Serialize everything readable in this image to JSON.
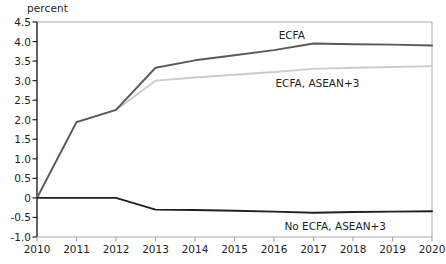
{
  "chart_data": {
    "type": "line",
    "title": "",
    "subtitle": "",
    "xlabel": "",
    "ylabel": "percent",
    "ylim": [
      -1.0,
      4.5
    ],
    "xlim": [
      2010,
      2020
    ],
    "grid": false,
    "legend_position": "inline-annotations",
    "ytick_labels": [
      "4.5",
      "4.0",
      "3.5",
      "3.0",
      "2.5",
      "2.0",
      "1.5",
      "1.0",
      "0.5",
      "0",
      "-0.5",
      "-1.0"
    ],
    "ytick_values": [
      4.5,
      4.0,
      3.5,
      3.0,
      2.5,
      2.0,
      1.5,
      1.0,
      0.5,
      0,
      -0.5,
      -1.0
    ],
    "x": [
      2010,
      2011,
      2012,
      2013,
      2014,
      2015,
      2016,
      2017,
      2018,
      2019,
      2020
    ],
    "xtick_labels": [
      "2010",
      "2011",
      "2012",
      "2013",
      "2014",
      "2015",
      "2016",
      "2017",
      "2018",
      "2019",
      "2020"
    ],
    "series": [
      {
        "name": "ECFA",
        "color": "#58595b",
        "width": 1.9,
        "values": [
          0.0,
          1.94,
          2.25,
          3.33,
          3.52,
          3.65,
          3.78,
          3.95,
          3.93,
          3.92,
          3.9
        ],
        "label": "ECFA",
        "label_x": 2016.45,
        "label_y": 4.18
      },
      {
        "name": "ECFA, ASEAN+3",
        "color": "#cccccc",
        "width": 1.9,
        "values": [
          0.0,
          1.94,
          2.25,
          3.0,
          3.08,
          3.15,
          3.22,
          3.3,
          3.33,
          3.35,
          3.37
        ],
        "label": "ECFA, ASEAN+3",
        "label_x": 2017.1,
        "label_y": 2.95
      },
      {
        "name": "No ECFA, ASEAN+3",
        "color": "#231f20",
        "width": 1.9,
        "values": [
          0.0,
          0.0,
          0.0,
          -0.3,
          -0.31,
          -0.33,
          -0.35,
          -0.38,
          -0.36,
          -0.35,
          -0.34
        ],
        "label": "No ECFA, ASEAN+3",
        "label_x": 2017.55,
        "label_y": -0.72
      }
    ]
  },
  "axes": {
    "axis_color": "#231f20",
    "frame_color": "#a7a9ac",
    "background": "#ffffff"
  }
}
